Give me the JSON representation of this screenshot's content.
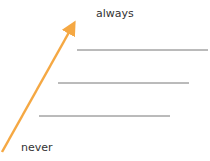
{
  "diagram": {
    "labels": {
      "top": "always",
      "bottom": "never"
    },
    "arrow": {
      "color": "#f5a843",
      "from": [
        2,
        152
      ],
      "to": [
        76,
        20
      ]
    },
    "lines": [
      {
        "x1": 77,
        "x2": 208,
        "y": 50
      },
      {
        "x1": 58,
        "x2": 189,
        "y": 83
      },
      {
        "x1": 39,
        "x2": 170,
        "y": 116
      }
    ],
    "line_color": "#777777"
  }
}
